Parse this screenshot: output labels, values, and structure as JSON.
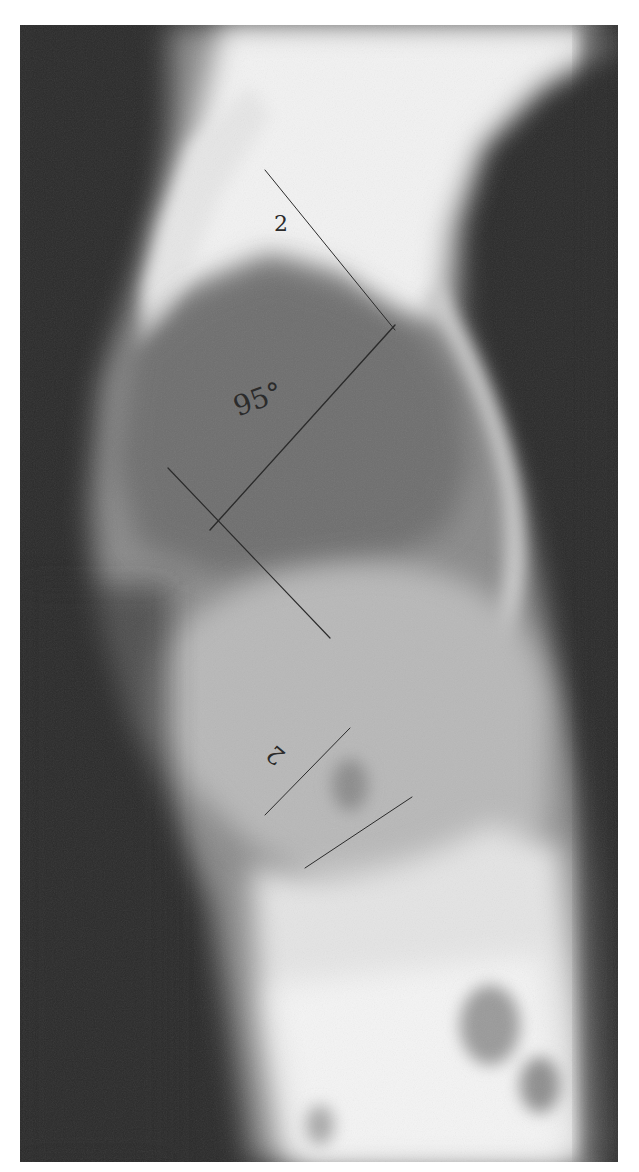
{
  "image": {
    "type": "lateral spine radiograph",
    "border_color": "#ffffff",
    "background_color": "#2a2a2a"
  },
  "annotations": {
    "upper_level_label": "2",
    "lower_level_label": "2",
    "angle_label": "95°"
  },
  "colors": {
    "annotation_ink": "#2b2b2b",
    "soft_tissue_dark": "#2a2a2a",
    "bone_bright": "#f4f4f4",
    "lung_gray": "#7a7a7a"
  }
}
